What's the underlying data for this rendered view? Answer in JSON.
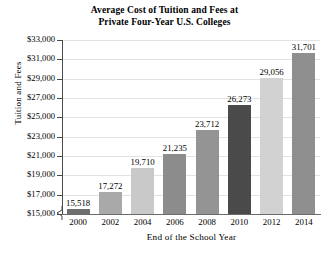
{
  "chart_data": {
    "type": "bar",
    "title": "Average Cost of Tuition and Fees at Private Four-Year U.S. Colleges",
    "title_line1": "Average Cost of Tuition and Fees at",
    "title_line2": "Private Four-Year U.S. Colleges",
    "xlabel": "End of the School Year",
    "ylabel": "Tuition and Fees",
    "categories": [
      "2000",
      "2002",
      "2004",
      "2006",
      "2008",
      "2010",
      "2012",
      "2014"
    ],
    "values": [
      15518,
      17272,
      19710,
      21235,
      23712,
      26273,
      29056,
      31701
    ],
    "value_labels": [
      "15,518",
      "17,272",
      "19,710",
      "21,235",
      "23,712",
      "26,273",
      "29,056",
      "31,701"
    ],
    "bar_colors": [
      "#6f6f6f",
      "#a9a9a9",
      "#c9c9c9",
      "#8c8c8c",
      "#949494",
      "#4a4a4a",
      "#d2d2d2",
      "#8f8f8f"
    ],
    "ylim": [
      15000,
      33000
    ],
    "ytick_values": [
      33000,
      31000,
      29000,
      27000,
      25000,
      23000,
      21000,
      19000,
      17000,
      15000
    ],
    "ytick_labels": [
      "$33,000",
      "$31,000",
      "$29,000",
      "$27,000",
      "$25,000",
      "$23,000",
      "$21,000",
      "$19,000",
      "$17,000",
      "$15,000"
    ],
    "grid": true,
    "legend": "none",
    "axis_break": true,
    "axis_break_note": "zigzag break on vertical axis below $15,000"
  }
}
